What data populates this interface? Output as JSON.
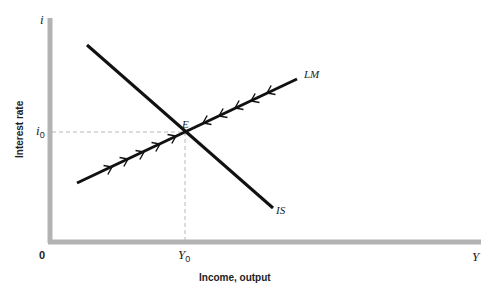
{
  "diagram": {
    "type": "IS-LM equilibrium diagram",
    "y_axis": {
      "symbol": "i",
      "title": "Interest rate",
      "tick": {
        "base": "i",
        "sub": "0"
      }
    },
    "x_axis": {
      "symbol": "Y",
      "title": "Income, output",
      "origin": "0",
      "tick": {
        "base": "Y",
        "sub": "0"
      }
    },
    "curves": [
      {
        "name": "IS",
        "label": "IS",
        "slope": "downward"
      },
      {
        "name": "LM",
        "label": "LM",
        "slope": "upward",
        "arrows": "pointing toward E from both sides"
      }
    ],
    "equilibrium": {
      "label": "E",
      "at": [
        "Y0",
        "i0"
      ]
    },
    "colors": {
      "axis": "#b3b3b3",
      "curve": "#111111",
      "guide": "#b8b8b8",
      "text": "#222222"
    }
  }
}
